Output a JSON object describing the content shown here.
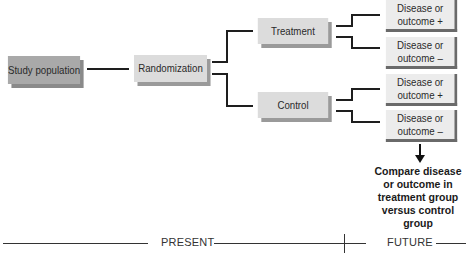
{
  "diagram": {
    "nodes": {
      "study_population": "Study population",
      "randomization": "Randomization",
      "treatment": "Treatment",
      "control": "Control",
      "treatment_outcome_pos": "Disease or outcome +",
      "treatment_outcome_neg": "Disease or outcome –",
      "control_outcome_pos": "Disease or outcome +",
      "control_outcome_neg": "Disease or outcome –"
    },
    "conclusion": "Compare disease or outcome in treatment group versus control group",
    "timeline": {
      "present": "PRESENT",
      "future": "FUTURE"
    }
  }
}
